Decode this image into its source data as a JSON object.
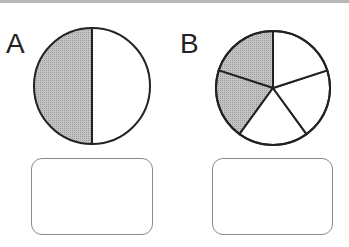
{
  "figures": [
    {
      "label": "A",
      "slices": 2,
      "shaded": 1,
      "answer_box": ""
    },
    {
      "label": "B",
      "slices": 5,
      "shaded": 2,
      "answer_box": ""
    }
  ],
  "colors": {
    "shade": "#b9b9b9",
    "stroke": "#222222",
    "box_border": "#8a8a8a"
  }
}
